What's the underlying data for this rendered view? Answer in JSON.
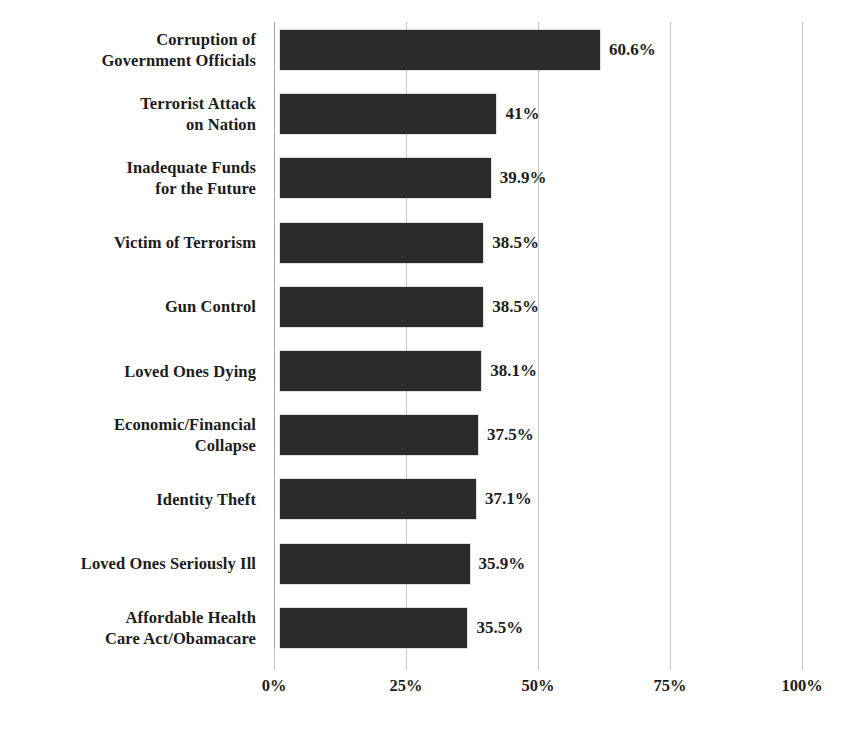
{
  "chart_data": {
    "type": "bar",
    "orientation": "horizontal",
    "title": "",
    "subtitle": "",
    "xlabel": "",
    "ylabel": "",
    "xlim": [
      0,
      100
    ],
    "grid": true,
    "legend": null,
    "tick_labels": [
      "0%",
      "25%",
      "50%",
      "75%",
      "100%"
    ],
    "tick_values": [
      0,
      25,
      50,
      75,
      100
    ],
    "categories": [
      "Corruption of Government Officials",
      "Terrorist Attack on Nation",
      "Inadequate Funds for the Future",
      "Victim of Terrorism",
      "Gun Control",
      "Loved Ones Dying",
      "Economic/Financial Collapse",
      "Identity Theft",
      "Loved Ones Seriously Ill",
      "Affordable Health Care Act/Obamacare"
    ],
    "values": [
      60.6,
      41,
      39.9,
      38.5,
      38.5,
      38.1,
      37.5,
      37.1,
      35.9,
      35.5
    ],
    "value_labels": [
      "60.6%",
      "41%",
      "39.9%",
      "38.5%",
      "38.5%",
      "38.1%",
      "37.5%",
      "37.1%",
      "35.9%",
      "35.5%"
    ],
    "bar_color": "#2b2b2b",
    "background_color": "#ffffff",
    "gridline_color": "#c9c9c9"
  },
  "rows": [
    {
      "label_lines": [
        "Corruption of",
        "Government Officials"
      ],
      "value": 60.6,
      "value_label": "60.6%"
    },
    {
      "label_lines": [
        "Terrorist Attack",
        "on Nation"
      ],
      "value": 41,
      "value_label": "41%"
    },
    {
      "label_lines": [
        "Inadequate Funds",
        "for the Future"
      ],
      "value": 39.9,
      "value_label": "39.9%"
    },
    {
      "label_lines": [
        "Victim of Terrorism"
      ],
      "value": 38.5,
      "value_label": "38.5%"
    },
    {
      "label_lines": [
        "Gun Control"
      ],
      "value": 38.5,
      "value_label": "38.5%"
    },
    {
      "label_lines": [
        "Loved Ones Dying"
      ],
      "value": 38.1,
      "value_label": "38.1%"
    },
    {
      "label_lines": [
        "Economic/Financial",
        "Collapse"
      ],
      "value": 37.5,
      "value_label": "37.5%"
    },
    {
      "label_lines": [
        "Identity Theft"
      ],
      "value": 37.1,
      "value_label": "37.1%"
    },
    {
      "label_lines": [
        "Loved Ones Seriously Ill"
      ],
      "value": 35.9,
      "value_label": "35.9%"
    },
    {
      "label_lines": [
        "Affordable Health",
        "Care Act/Obamacare"
      ],
      "value": 35.5,
      "value_label": "35.5%"
    }
  ],
  "axis": {
    "ticks": [
      {
        "label": "0%",
        "value": 0
      },
      {
        "label": "25%",
        "value": 25
      },
      {
        "label": "50%",
        "value": 50
      },
      {
        "label": "75%",
        "value": 75
      },
      {
        "label": "100%",
        "value": 100
      }
    ]
  }
}
